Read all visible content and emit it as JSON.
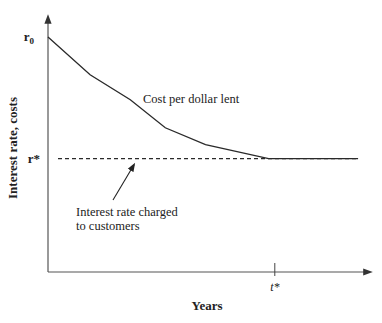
{
  "chart_data": {
    "type": "line",
    "title": "",
    "xlabel": "Years",
    "ylabel": "Interest rate, costs",
    "x_ticks": [
      {
        "label": "t*",
        "x": 0.7
      }
    ],
    "y_ticks": [
      {
        "label": "r0",
        "label_main": "r",
        "label_sub": "0",
        "y": 1.0
      },
      {
        "label": "r*",
        "label_main": "r*",
        "label_sub": "",
        "y": 0.0
      }
    ],
    "xlim": [
      0,
      1
    ],
    "ylim": [
      -0.93,
      1.18
    ],
    "grid": false,
    "legend": "none",
    "series": [
      {
        "name": "Cost per dollar lent",
        "style": "solid",
        "x": [
          0.0,
          0.13,
          0.254,
          0.362,
          0.486,
          0.681,
          0.957
        ],
        "y": [
          1.0,
          0.689,
          0.484,
          0.254,
          0.115,
          0.0,
          0.0
        ]
      },
      {
        "name": "Interest rate charged to customers",
        "style": "dashed",
        "x": [
          0.031,
          0.957
        ],
        "y": [
          0.0,
          0.0
        ]
      }
    ],
    "annotations": [
      {
        "text": "Cost per dollar lent",
        "target_series": 0
      },
      {
        "text_lines": [
          "Interest rate charged",
          "to customers"
        ],
        "target_series": 1,
        "arrow": true
      }
    ],
    "colors": {
      "line": "#2a2a2a",
      "axis": "#555555",
      "text": "#222222"
    }
  }
}
